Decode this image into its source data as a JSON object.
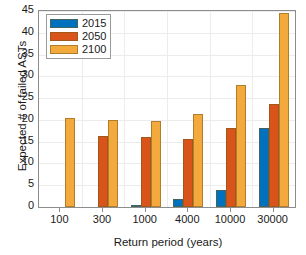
{
  "chart_data": {
    "type": "bar",
    "title": "",
    "xlabel": "Return period (years)",
    "ylabel": "Expected # of failed ASTs",
    "categories": [
      "100",
      "300",
      "1000",
      "4000",
      "10000",
      "30000"
    ],
    "series": [
      {
        "name": "2015",
        "color": "#0072BD",
        "values": [
          0,
          0,
          0.3,
          1.8,
          3.8,
          18.1
        ]
      },
      {
        "name": "2050",
        "color": "#D9541A",
        "values": [
          0,
          16.3,
          16.0,
          15.7,
          18.2,
          23.6
        ]
      },
      {
        "name": "2100",
        "color": "#F4A93C",
        "values": [
          20.4,
          20.0,
          19.8,
          21.3,
          27.9,
          44.5
        ]
      }
    ],
    "ylim": [
      0,
      45
    ],
    "yticks": [
      0,
      5,
      10,
      15,
      20,
      25,
      30,
      35,
      40,
      45
    ],
    "yticklabels": [
      "0",
      "5",
      "10",
      "15",
      "20",
      "25",
      "30",
      "35",
      "40",
      "45"
    ],
    "grid": true,
    "legend_position": "upper left",
    "legend_entries": [
      "2015",
      "2050",
      "2100"
    ]
  }
}
